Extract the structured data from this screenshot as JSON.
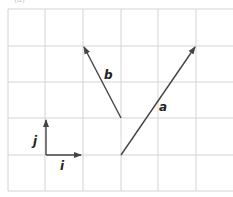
{
  "caption": "(a)",
  "grid": {
    "cell_px": 37,
    "origin_px": [
      8,
      9
    ],
    "columns_visible": 6,
    "rows": 5,
    "line_color": "#d4d4d4"
  },
  "vectors": [
    {
      "name": "i",
      "label": "i",
      "from": [
        1,
        4
      ],
      "to": [
        2,
        4
      ],
      "components": [
        1,
        0
      ]
    },
    {
      "name": "j",
      "label": "j",
      "from": [
        1,
        4
      ],
      "to": [
        1,
        3
      ],
      "components": [
        0,
        1
      ]
    },
    {
      "name": "a",
      "label": "a",
      "from": [
        3,
        4
      ],
      "to": [
        5,
        1
      ],
      "components": [
        2,
        3
      ]
    },
    {
      "name": "b",
      "label": "b",
      "from": [
        3,
        3
      ],
      "to": [
        2,
        1
      ],
      "components": [
        -1,
        2
      ]
    }
  ],
  "labels": {
    "i": "i",
    "j": "j",
    "a": "a",
    "b": "b"
  },
  "colors": {
    "vector": "#444444",
    "label": "#222222",
    "grid": "#d4d4d4"
  }
}
